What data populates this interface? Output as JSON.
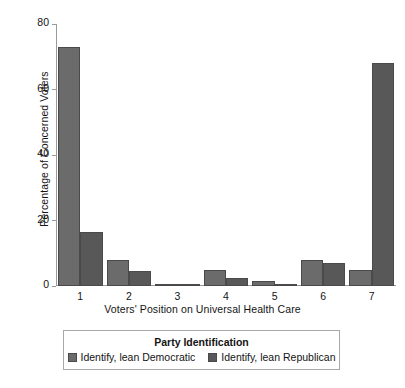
{
  "chart_data": {
    "type": "bar",
    "title": "",
    "subtitle": "",
    "xlabel": "Voters' Position on Universal Health Care",
    "ylabel": "Percentage of Concerned Voters",
    "categories": [
      "1",
      "2",
      "3",
      "4",
      "5",
      "6",
      "7"
    ],
    "series": [
      {
        "name": "Identify, lean Democratic",
        "color": "#6b6b6b",
        "values": [
          73,
          8,
          0.6,
          5,
          1.5,
          8,
          5
        ]
      },
      {
        "name": "Identify, lean Republican",
        "color": "#585858",
        "values": [
          16.5,
          4.5,
          0.3,
          2.5,
          0.6,
          7,
          68
        ]
      }
    ],
    "ylim": [
      0,
      80
    ],
    "yticks": [
      0,
      20,
      40,
      60,
      80
    ],
    "ytick_labels": [
      "0",
      "20",
      "40",
      "60",
      "80"
    ],
    "grid": false,
    "legend_position": "bottom",
    "legend_title": "Party Identification"
  },
  "axes": {
    "y_title": "Percentage of Concerned Voters",
    "x_title": "Voters' Position on Universal Health Care"
  },
  "legend": {
    "title": "Party Identification",
    "entries": [
      {
        "label": "Identify, lean Democratic",
        "color": "#6b6b6b"
      },
      {
        "label": "Identify, lean Republican",
        "color": "#585858"
      }
    ]
  },
  "colors": {
    "democratic": "#6b6b6b",
    "republican": "#585858",
    "axis": "#9a9a9a",
    "bar_outline": "#4a4a4a",
    "background": "#ffffff",
    "text": "#141414"
  }
}
